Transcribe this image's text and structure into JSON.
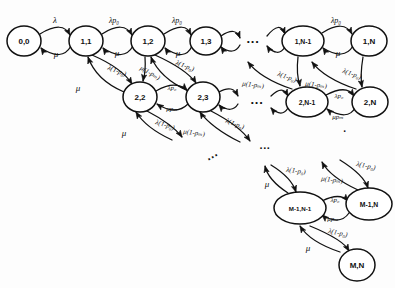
{
  "figure": {
    "type": "state-transition-diagram",
    "stroke_color": "#111111",
    "background_color": "#fdfdfd"
  },
  "symbols": {
    "lambda": "λ",
    "mu": "μ",
    "p0": "p₀",
    "pm": "pₘ"
  },
  "rates": {
    "lambda": "λ",
    "mu": "μ",
    "lambda_p0": "λp₀",
    "mu_pm": "μpₘ",
    "lambda_1_minus_p0": "λ(1-p₀)",
    "mu_1_minus_pm": "μ(1-pₘ)"
  },
  "nodes": [
    {
      "id": "n00",
      "label": "0,0",
      "cx": 24,
      "cy": 41,
      "rx": 17,
      "ry": 15
    },
    {
      "id": "n11",
      "label": "1,1",
      "cx": 86,
      "cy": 41,
      "rx": 17,
      "ry": 15
    },
    {
      "id": "n12",
      "label": "1,2",
      "cx": 148,
      "cy": 41,
      "rx": 17,
      "ry": 15
    },
    {
      "id": "n13",
      "label": "1,3",
      "cx": 206,
      "cy": 41,
      "rx": 16,
      "ry": 14
    },
    {
      "id": "n1N1",
      "label": "1,N-1",
      "cx": 303,
      "cy": 41,
      "rx": 21,
      "ry": 15
    },
    {
      "id": "n1N",
      "label": "1,N",
      "cx": 369,
      "cy": 41,
      "rx": 18,
      "ry": 15
    },
    {
      "id": "n22",
      "label": "2,2",
      "cx": 140,
      "cy": 97,
      "rx": 17,
      "ry": 15
    },
    {
      "id": "n23",
      "label": "2,3",
      "cx": 203,
      "cy": 97,
      "rx": 17,
      "ry": 15
    },
    {
      "id": "n2N1",
      "label": "2,N-1",
      "cx": 307,
      "cy": 102,
      "rx": 21,
      "ry": 15
    },
    {
      "id": "n2N",
      "label": "2,N",
      "cx": 370,
      "cy": 102,
      "rx": 18,
      "ry": 15
    },
    {
      "id": "nM1N1",
      "label": "M-1,N-1",
      "cx": 300,
      "cy": 208,
      "rx": 26,
      "ry": 16
    },
    {
      "id": "nM1N",
      "label": "M-1,N",
      "cx": 369,
      "cy": 204,
      "rx": 23,
      "ry": 16
    },
    {
      "id": "nMN",
      "label": "M,N",
      "cx": 357,
      "cy": 265,
      "rx": 18,
      "ry": 16
    }
  ],
  "ellipses": [
    {
      "id": "e-row1",
      "text": "···",
      "x": 253,
      "y": 41,
      "rotate": 0,
      "size": 13
    },
    {
      "id": "e-row2",
      "text": "···",
      "x": 257,
      "y": 102,
      "rotate": 0,
      "size": 13
    },
    {
      "id": "e-mid",
      "text": "···",
      "x": 213,
      "y": 157,
      "rotate": -30,
      "size": 12
    },
    {
      "id": "e-low",
      "text": "···",
      "x": 265,
      "y": 148,
      "rotate": 0,
      "size": 11
    },
    {
      "id": "e-right",
      "text": "·",
      "x": 345,
      "y": 131,
      "rotate": 0,
      "size": 10
    }
  ],
  "edge_labels": [
    {
      "id": "l-00-11-top",
      "text": "λ",
      "x": 55,
      "y": 20,
      "size": 9,
      "rotate": 0
    },
    {
      "id": "l-00-11-bot",
      "text": "μ",
      "x": 56,
      "y": 54,
      "size": 9,
      "rotate": 0
    },
    {
      "id": "l-11-12-top",
      "text": "λp₀",
      "x": 114,
      "y": 20,
      "size": 8,
      "rotate": 0
    },
    {
      "id": "l-11-12-bot",
      "text": "μ",
      "x": 117,
      "y": 53,
      "size": 9,
      "rotate": 0
    },
    {
      "id": "l-12-13-top",
      "text": "λp₀",
      "x": 177,
      "y": 20,
      "size": 8,
      "rotate": 0
    },
    {
      "id": "l-12-13-bot",
      "text": "μ",
      "x": 178,
      "y": 53,
      "size": 9,
      "rotate": 0
    },
    {
      "id": "l-1N1-1N-top",
      "text": "λp₀",
      "x": 336,
      "y": 20,
      "size": 8,
      "rotate": 0
    },
    {
      "id": "l-1N1-1N-bot",
      "text": "μ",
      "x": 338,
      "y": 53,
      "size": 9,
      "rotate": 0
    },
    {
      "id": "l-11-22-dn",
      "text": "λ(1-p₀)",
      "x": 117,
      "y": 71,
      "size": 7,
      "rotate": 22
    },
    {
      "id": "l-11-22-up",
      "text": "μ",
      "x": 78,
      "y": 88,
      "size": 9,
      "rotate": 0
    },
    {
      "id": "l-12-22-dn",
      "text": "μ(1-pₘ)",
      "x": 150,
      "y": 73,
      "size": 7,
      "rotate": 30
    },
    {
      "id": "l-12-23-dn",
      "text": "λ(1-p₀)",
      "x": 185,
      "y": 66,
      "size": 7,
      "rotate": 22
    },
    {
      "id": "l-22-23-top",
      "text": "λp₀",
      "x": 172,
      "y": 88,
      "size": 7,
      "rotate": 0
    },
    {
      "id": "l-22-23-bot",
      "text": "μpₘ",
      "x": 172,
      "y": 109,
      "size": 7,
      "rotate": 0
    },
    {
      "id": "l-22-dn",
      "text": "λ(1-p₀)",
      "x": 165,
      "y": 125,
      "size": 7,
      "rotate": 18
    },
    {
      "id": "l-22-up",
      "text": "μ",
      "x": 124,
      "y": 133,
      "size": 9,
      "rotate": 0
    },
    {
      "id": "l-23-dn",
      "text": "λ(1-p₀)",
      "x": 235,
      "y": 124,
      "size": 7,
      "rotate": 22
    },
    {
      "id": "l-23-up",
      "text": "μ(1-pₘ)",
      "x": 194,
      "y": 133,
      "size": 7,
      "rotate": 8
    },
    {
      "id": "l-1N1-dn",
      "text": "λ(1-p₀)",
      "x": 287,
      "y": 77,
      "size": 7,
      "rotate": 20
    },
    {
      "id": "l-1N-dn",
      "text": "λ(1-p₀)",
      "x": 352,
      "y": 74,
      "size": 7,
      "rotate": 20
    },
    {
      "id": "l-2N1-up",
      "text": "μ(1-pₘ)",
      "x": 253,
      "y": 85,
      "size": 7,
      "rotate": 8
    },
    {
      "id": "l-2N-up",
      "text": "μ(1-pₘ)",
      "x": 316,
      "y": 85,
      "size": 7,
      "rotate": 8
    },
    {
      "id": "l-2N1-bot",
      "text": "λp₀",
      "x": 339,
      "y": 96,
      "size": 7,
      "rotate": 0
    },
    {
      "id": "l-2N1-bot2",
      "text": "μpₘ",
      "x": 338,
      "y": 117,
      "size": 7,
      "rotate": 0
    },
    {
      "id": "l-M1-in-a",
      "text": "λ(1-p₀)",
      "x": 296,
      "y": 171,
      "size": 7,
      "rotate": 8
    },
    {
      "id": "l-M1-in-b",
      "text": "λ(1-p₀)",
      "x": 366,
      "y": 166,
      "size": 7,
      "rotate": 12
    },
    {
      "id": "l-M1-up",
      "text": "μ",
      "x": 267,
      "y": 184,
      "size": 9,
      "rotate": 0
    },
    {
      "id": "l-M1-up2",
      "text": "μ(1-pₘ)",
      "x": 332,
      "y": 180,
      "size": 7,
      "rotate": 8
    },
    {
      "id": "l-M1-mid-top",
      "text": "λp₀",
      "x": 335,
      "y": 200,
      "size": 7,
      "rotate": 0
    },
    {
      "id": "l-M1-mid-bot",
      "text": "μpₘ",
      "x": 333,
      "y": 219,
      "size": 7,
      "rotate": 0
    },
    {
      "id": "l-MN-in",
      "text": "λ(1-p₀)",
      "x": 338,
      "y": 233,
      "size": 7,
      "rotate": 12
    },
    {
      "id": "l-MN-up",
      "text": "μ",
      "x": 308,
      "y": 248,
      "size": 9,
      "rotate": 0
    }
  ],
  "edges": [
    {
      "id": "e-00-11-f",
      "d": "M 40,34 Q 63,20 70,35"
    },
    {
      "id": "e-00-11-b",
      "d": "M 71,46 Q 62,62 41,48"
    },
    {
      "id": "e-11-12-f",
      "d": "M 102,34 Q 124,20 132,35"
    },
    {
      "id": "e-11-12-b",
      "d": "M 133,46 Q 124,62 103,48"
    },
    {
      "id": "e-12-13-f",
      "d": "M 164,34 Q 186,20 191,35"
    },
    {
      "id": "e-12-13-b",
      "d": "M 192,46 Q 185,62 165,48"
    },
    {
      "id": "e-13-r-f",
      "d": "M 221,36 Q 236,26 240,38"
    },
    {
      "id": "e-13-r-b",
      "d": "M 240,45 Q 234,56 221,47"
    },
    {
      "id": "e-l-1N1-f",
      "d": "M 267,36 Q 280,20 285,34"
    },
    {
      "id": "e-l-1N1-b",
      "d": "M 285,47 Q 278,58 267,46"
    },
    {
      "id": "e-1N1-1N-f",
      "d": "M 322,33 Q 344,19 352,34"
    },
    {
      "id": "e-1N1-1N-b",
      "d": "M 353,46 Q 344,61 323,48"
    },
    {
      "id": "e-11-22-d",
      "d": "M 92,55 Q 122,68 132,84"
    },
    {
      "id": "e-22-11-u",
      "d": "M 124,92 Q 96,80 88,57"
    },
    {
      "id": "e-12-22-d",
      "d": "M 145,57 Q 146,72 143,81"
    },
    {
      "id": "e-12-23-d",
      "d": "M 155,55 Q 186,69 196,83"
    },
    {
      "id": "e-23-12-u",
      "d": "M 188,91 Q 160,78 151,57"
    },
    {
      "id": "e-22-23-f",
      "d": "M 156,91 Q 175,80 187,90"
    },
    {
      "id": "e-22-23-b",
      "d": "M 188,104 Q 176,116 157,104"
    },
    {
      "id": "e-23-r-f",
      "d": "M 219,92 Q 233,84 238,96"
    },
    {
      "id": "e-23-r-b",
      "d": "M 238,104 Q 232,114 219,105"
    },
    {
      "id": "e-l-2N1-f",
      "d": "M 271,96 Q 283,84 288,96"
    },
    {
      "id": "e-l-2N1-b",
      "d": "M 288,108 Q 282,118 271,108"
    },
    {
      "id": "e-2N1-2N-f",
      "d": "M 326,95 Q 347,84 354,96"
    },
    {
      "id": "e-2N1-2N-b",
      "d": "M 355,108 Q 348,121 327,109"
    },
    {
      "id": "e-22-dn",
      "d": "M 147,111 Q 172,124 182,137"
    },
    {
      "id": "e-22-up",
      "d": "M 172,140 Q 146,128 136,112"
    },
    {
      "id": "e-23-dn",
      "d": "M 211,111 Q 240,126 250,141"
    },
    {
      "id": "e-23-up",
      "d": "M 240,142 Q 212,128 200,112"
    },
    {
      "id": "e-1N1-dn",
      "d": "M 298,57 Q 296,74 300,86"
    },
    {
      "id": "e-2N1-up",
      "d": "M 292,89 Q 260,78 248,62"
    },
    {
      "id": "e-1N-dn",
      "d": "M 363,57 Q 360,75 362,87"
    },
    {
      "id": "e-2N-up",
      "d": "M 356,89 Q 324,78 312,62"
    },
    {
      "id": "e-M1-in-a",
      "d": "M 271,165 Q 292,178 296,192"
    },
    {
      "id": "e-M1-up-a",
      "d": "M 288,193 Q 268,180 265,166"
    },
    {
      "id": "e-M1-in-b",
      "d": "M 340,160 Q 364,175 368,188"
    },
    {
      "id": "e-M1-up-b",
      "d": "M 358,190 Q 330,177 322,162"
    },
    {
      "id": "e-M1-f",
      "d": "M 322,201 Q 340,192 348,201"
    },
    {
      "id": "e-M1-b",
      "d": "M 349,213 Q 340,226 322,215"
    },
    {
      "id": "e-MN-in",
      "d": "M 310,226 Q 344,240 349,251"
    },
    {
      "id": "e-MN-up",
      "d": "M 340,252 Q 310,242 300,226"
    }
  ],
  "arrowheads": [
    {
      "id": "a-00-11-f",
      "x": 70,
      "y": 35,
      "rotate": 62
    },
    {
      "id": "a-00-11-b",
      "x": 41,
      "y": 48,
      "rotate": 236
    },
    {
      "id": "a-11-12-f",
      "x": 132,
      "y": 35,
      "rotate": 62
    },
    {
      "id": "a-11-12-b",
      "x": 103,
      "y": 48,
      "rotate": 236
    },
    {
      "id": "a-12-13-f",
      "x": 191,
      "y": 35,
      "rotate": 62
    },
    {
      "id": "a-12-13-b",
      "x": 165,
      "y": 48,
      "rotate": 236
    },
    {
      "id": "a-13-r-f",
      "x": 240,
      "y": 38,
      "rotate": 68
    },
    {
      "id": "a-13-r-b",
      "x": 221,
      "y": 47,
      "rotate": 236
    },
    {
      "id": "a-l-1N1-f",
      "x": 285,
      "y": 34,
      "rotate": 68
    },
    {
      "id": "a-l-1N1-b",
      "x": 267,
      "y": 46,
      "rotate": 236
    },
    {
      "id": "a-1N1-1N-f",
      "x": 352,
      "y": 34,
      "rotate": 62
    },
    {
      "id": "a-1N1-1N-b",
      "x": 323,
      "y": 48,
      "rotate": 236
    },
    {
      "id": "a-11-22-d",
      "x": 132,
      "y": 84,
      "rotate": 58
    },
    {
      "id": "a-22-11-u",
      "x": 88,
      "y": 57,
      "rotate": 250
    },
    {
      "id": "a-12-22-d",
      "x": 143,
      "y": 81,
      "rotate": 100
    },
    {
      "id": "a-12-23-d",
      "x": 196,
      "y": 83,
      "rotate": 58
    },
    {
      "id": "a-23-12-u",
      "x": 151,
      "y": 57,
      "rotate": 250
    },
    {
      "id": "a-22-23-f",
      "x": 187,
      "y": 90,
      "rotate": 45
    },
    {
      "id": "a-22-23-b",
      "x": 157,
      "y": 104,
      "rotate": 215
    },
    {
      "id": "a-23-r-f",
      "x": 238,
      "y": 96,
      "rotate": 62
    },
    {
      "id": "a-23-r-b",
      "x": 219,
      "y": 105,
      "rotate": 230
    },
    {
      "id": "a-l-2N1-f",
      "x": 288,
      "y": 96,
      "rotate": 62
    },
    {
      "id": "a-l-2N1-b",
      "x": 271,
      "y": 108,
      "rotate": 230
    },
    {
      "id": "a-2N1-2N-f",
      "x": 354,
      "y": 96,
      "rotate": 55
    },
    {
      "id": "a-2N1-2N-b",
      "x": 327,
      "y": 109,
      "rotate": 222
    },
    {
      "id": "a-22-dn",
      "x": 182,
      "y": 137,
      "rotate": 55
    },
    {
      "id": "a-22-up",
      "x": 136,
      "y": 112,
      "rotate": 238
    },
    {
      "id": "a-23-dn",
      "x": 250,
      "y": 141,
      "rotate": 55
    },
    {
      "id": "a-23-up",
      "x": 200,
      "y": 112,
      "rotate": 238
    },
    {
      "id": "a-1N1-dn",
      "x": 300,
      "y": 86,
      "rotate": 80
    },
    {
      "id": "a-2N1-up",
      "x": 248,
      "y": 62,
      "rotate": 232
    },
    {
      "id": "a-1N-dn",
      "x": 362,
      "y": 87,
      "rotate": 80
    },
    {
      "id": "a-2N-up",
      "x": 312,
      "y": 62,
      "rotate": 232
    },
    {
      "id": "a-M1-in-a",
      "x": 296,
      "y": 192,
      "rotate": 72
    },
    {
      "id": "a-M1-up-a",
      "x": 265,
      "y": 166,
      "rotate": 256
    },
    {
      "id": "a-M1-in-b",
      "x": 368,
      "y": 188,
      "rotate": 72
    },
    {
      "id": "a-M1-up-b",
      "x": 322,
      "y": 162,
      "rotate": 242
    },
    {
      "id": "a-M1-f",
      "x": 348,
      "y": 201,
      "rotate": 50
    },
    {
      "id": "a-M1-b",
      "x": 322,
      "y": 215,
      "rotate": 222
    },
    {
      "id": "a-MN-in",
      "x": 349,
      "y": 251,
      "rotate": 60
    },
    {
      "id": "a-MN-up",
      "x": 300,
      "y": 226,
      "rotate": 238
    }
  ]
}
